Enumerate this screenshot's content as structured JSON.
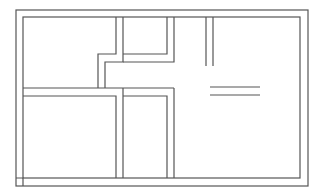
{
  "diagram": {
    "type": "floor-plan",
    "canvas": {
      "width": 318,
      "height": 194,
      "background": "#ffffff"
    },
    "stroke": {
      "color": "#555555",
      "width": 1.2
    },
    "outer_wall": {
      "x": 16,
      "y": 10,
      "w": 292,
      "h": 176
    },
    "inner_wall": {
      "x": 23,
      "y": 17,
      "w": 277,
      "h": 161
    },
    "walls": [
      {
        "name": "upper-corridor-left-a",
        "points": [
          [
            116,
            17
          ],
          [
            116,
            54
          ],
          [
            98,
            54
          ],
          [
            98,
            88
          ]
        ]
      },
      {
        "name": "upper-corridor-left-b",
        "points": [
          [
            123,
            17
          ],
          [
            123,
            62
          ],
          [
            105,
            62
          ],
          [
            105,
            88
          ]
        ]
      },
      {
        "name": "upper-corridor-right-a",
        "points": [
          [
            167,
            17
          ],
          [
            167,
            54
          ],
          [
            123,
            54
          ]
        ]
      },
      {
        "name": "upper-corridor-right-b",
        "points": [
          [
            174,
            17
          ],
          [
            174,
            62
          ],
          [
            123,
            62
          ]
        ]
      },
      {
        "name": "mid-wall-top",
        "points": [
          [
            23,
            88
          ],
          [
            174,
            88
          ]
        ]
      },
      {
        "name": "mid-wall-bottom-left",
        "points": [
          [
            23,
            96
          ],
          [
            116,
            96
          ],
          [
            116,
            178
          ]
        ]
      },
      {
        "name": "mid-wall-bottom-mid",
        "points": [
          [
            123,
            88
          ],
          [
            123,
            178
          ]
        ]
      },
      {
        "name": "lower-right-room-a",
        "points": [
          [
            123,
            96
          ],
          [
            167,
            96
          ],
          [
            167,
            178
          ]
        ]
      },
      {
        "name": "lower-right-room-b",
        "points": [
          [
            174,
            88
          ],
          [
            174,
            178
          ]
        ]
      },
      {
        "name": "partition-right-a",
        "points": [
          [
            206,
            17
          ],
          [
            206,
            66
          ]
        ]
      },
      {
        "name": "partition-right-b",
        "points": [
          [
            213,
            17
          ],
          [
            213,
            66
          ]
        ]
      },
      {
        "name": "counter-top",
        "points": [
          [
            210,
            87
          ],
          [
            260,
            87
          ]
        ]
      },
      {
        "name": "counter-bottom",
        "points": [
          [
            210,
            95
          ],
          [
            260,
            95
          ]
        ]
      },
      {
        "name": "corner-joint-left",
        "points": [
          [
            16,
            178
          ],
          [
            23,
            178
          ],
          [
            23,
            186
          ]
        ]
      }
    ]
  }
}
